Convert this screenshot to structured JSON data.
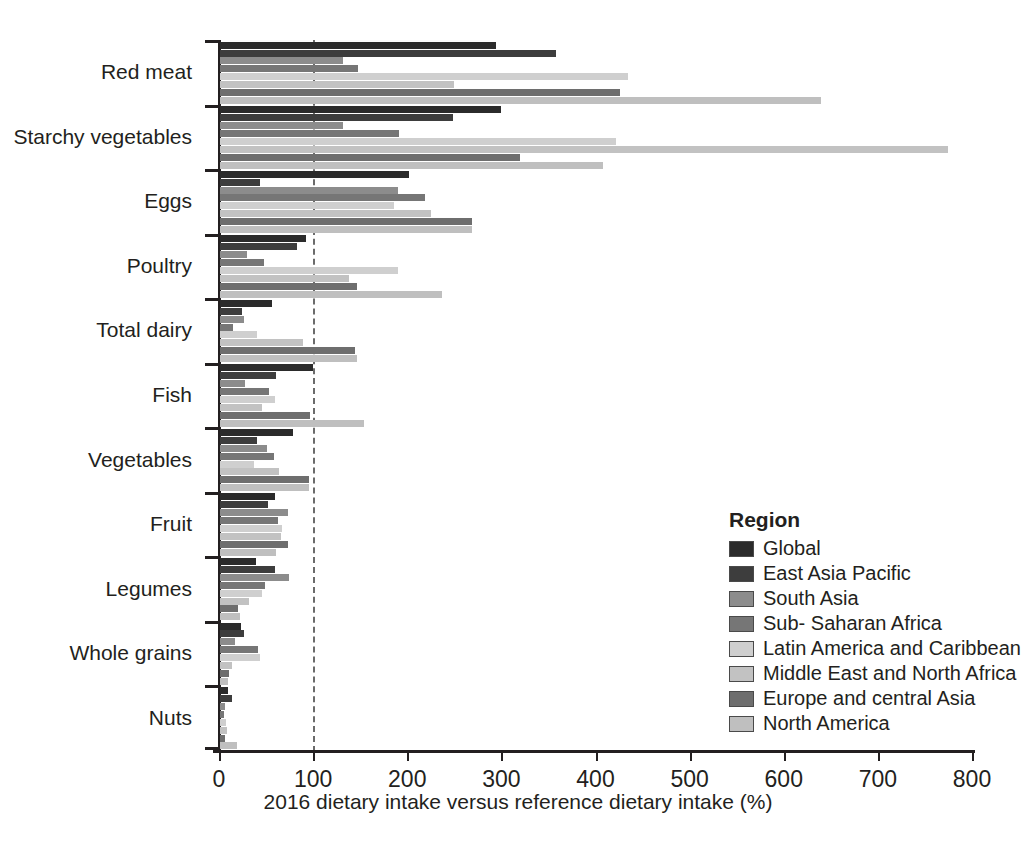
{
  "chart_data": {
    "type": "bar",
    "orientation": "horizontal",
    "title": "",
    "xlabel": "2016 dietary intake versus reference dietary intake (%)",
    "ylabel": "",
    "xlim": [
      0,
      800
    ],
    "xticks": [
      0,
      100,
      200,
      300,
      400,
      500,
      600,
      700,
      800
    ],
    "grid": false,
    "reference_line": 100,
    "legend_title": "Region",
    "legend_position": "inside-right-lower",
    "categories": [
      "Red meat",
      "Starchy vegetables",
      "Eggs",
      "Poultry",
      "Total dairy",
      "Fish",
      "Vegetables",
      "Fruit",
      "Legumes",
      "Whole grains",
      "Nuts"
    ],
    "series": [
      {
        "name": "Global",
        "color": "#2b2b2b",
        "values": [
          293,
          299,
          201,
          91,
          55,
          99,
          78,
          58,
          38,
          22,
          8
        ]
      },
      {
        "name": "East Asia Pacific",
        "color": "#3d3d3d",
        "values": [
          357,
          248,
          43,
          82,
          23,
          60,
          39,
          51,
          58,
          26,
          13
        ]
      },
      {
        "name": "South Asia",
        "color": "#8c8c8c",
        "values": [
          131,
          131,
          189,
          29,
          25,
          27,
          50,
          72,
          73,
          16,
          5
        ]
      },
      {
        "name": "Sub- Saharan Africa",
        "color": "#767676",
        "values": [
          147,
          190,
          218,
          47,
          14,
          52,
          57,
          62,
          48,
          40,
          4
        ]
      },
      {
        "name": "Latin America and Caribbean",
        "color": "#cfcfcf",
        "values": [
          433,
          421,
          185,
          189,
          39,
          58,
          36,
          66,
          45,
          42,
          6
        ]
      },
      {
        "name": "Middle East and North Africa",
        "color": "#c2c2c2",
        "values": [
          249,
          773,
          224,
          137,
          88,
          45,
          63,
          65,
          31,
          13,
          7
        ]
      },
      {
        "name": "Europe and central Asia",
        "color": "#6e6e6e",
        "values": [
          425,
          319,
          268,
          146,
          143,
          96,
          95,
          72,
          19,
          10,
          5
        ]
      },
      {
        "name": "North America",
        "color": "#bfbfbf",
        "values": [
          639,
          407,
          268,
          236,
          146,
          153,
          95,
          60,
          21,
          9,
          18
        ]
      }
    ]
  },
  "axis": {
    "x_title": "2016 dietary intake versus reference dietary intake (%)",
    "tick_labels": [
      "0",
      "100",
      "200",
      "300",
      "400",
      "500",
      "600",
      "700",
      "800"
    ]
  },
  "legend": {
    "title": "Region",
    "items": [
      {
        "label": "Global",
        "color": "#2b2b2b"
      },
      {
        "label": "East Asia Pacific",
        "color": "#3d3d3d"
      },
      {
        "label": "South Asia",
        "color": "#8c8c8c"
      },
      {
        "label": "Sub- Saharan Africa",
        "color": "#767676"
      },
      {
        "label": "Latin America and Caribbean",
        "color": "#cfcfcf"
      },
      {
        "label": "Middle East and North Africa",
        "color": "#c2c2c2"
      },
      {
        "label": "Europe and central Asia",
        "color": "#6e6e6e"
      },
      {
        "label": "North America",
        "color": "#bfbfbf"
      }
    ]
  }
}
